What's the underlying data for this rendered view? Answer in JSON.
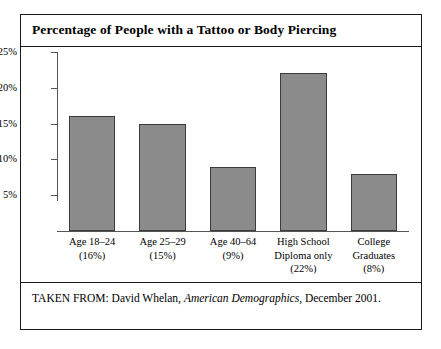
{
  "figure": {
    "title": "Percentage of People with a Tattoo or Body Piercing",
    "source_prefix": "TAKEN FROM: David Whelan,",
    "source_italic": "American Demographics",
    "source_suffix": ", December 2001.",
    "border_color": "#1a1a1a",
    "bar_fill_color": "#8b8b8b",
    "bar_edge_color": "#3b3b3b",
    "axis_color": "#555555",
    "background_color": "#ffffff"
  },
  "chart_data": {
    "type": "bar",
    "title": "Percentage of People with a Tattoo or Body Piercing",
    "xlabel": "",
    "ylabel": "",
    "categories": [
      "Age 18–24",
      "Age 25–29",
      "Age 40–64",
      "High School Diploma only",
      "College Graduates"
    ],
    "category_lines": [
      [
        "Age 18–24",
        "(16%)"
      ],
      [
        "Age 25–29",
        "(15%)"
      ],
      [
        "Age 40–64",
        "(9%)"
      ],
      [
        "High School",
        "Diploma only",
        "(22%)"
      ],
      [
        "College",
        "Graduates",
        "(8%)"
      ]
    ],
    "values": [
      16,
      15,
      9,
      22,
      8
    ],
    "value_labels": [
      "16%",
      "15%",
      "9%",
      "22%",
      "8%"
    ],
    "ylim": [
      0,
      25
    ],
    "yticks": [
      5,
      10,
      15,
      20,
      25
    ],
    "ytick_labels": [
      "5%",
      "10%",
      "15%",
      "20%",
      "25%"
    ],
    "grid": false,
    "legend": false
  }
}
